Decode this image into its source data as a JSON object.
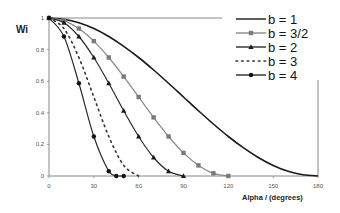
{
  "chart_data": {
    "type": "line",
    "title": "",
    "xlabel": "Alpha / (degrees)",
    "ylabel": "Wi",
    "xlim": [
      0,
      180
    ],
    "ylim": [
      0,
      1
    ],
    "x_ticks": [
      0,
      30,
      60,
      90,
      120,
      150,
      180
    ],
    "x_tick_labels": [
      "0",
      "30",
      "60",
      "90",
      "120",
      "150",
      "180"
    ],
    "y_ticks": [
      0,
      0.2,
      0.4,
      0.6,
      0.8,
      1
    ],
    "y_tick_labels": [
      "0",
      "0.2",
      "0.4",
      "0.6",
      "0.8",
      "1"
    ],
    "grid": false,
    "legend_position": "top-right",
    "series": [
      {
        "name": "b = 1",
        "style": "solid",
        "marker": "none",
        "color": "#1a1a1a",
        "width": 1.6,
        "x": [
          0,
          10,
          20,
          30,
          40,
          50,
          60,
          70,
          80,
          90,
          100,
          110,
          120,
          130,
          140,
          150,
          160,
          170,
          180
        ],
        "values": [
          1,
          0.992,
          0.97,
          0.933,
          0.883,
          0.821,
          0.75,
          0.671,
          0.587,
          0.5,
          0.413,
          0.329,
          0.25,
          0.179,
          0.117,
          0.067,
          0.03,
          0.008,
          0
        ]
      },
      {
        "name": "b = 3/2",
        "style": "solid",
        "marker": "square",
        "color": "#888888",
        "marker_color": "#7a7a7a",
        "width": 1.2,
        "x": [
          0,
          10,
          20,
          30,
          40,
          50,
          60,
          70,
          80,
          90,
          100,
          110,
          120
        ],
        "values": [
          1,
          0.983,
          0.933,
          0.854,
          0.75,
          0.629,
          0.5,
          0.371,
          0.25,
          0.146,
          0.067,
          0.017,
          0
        ]
      },
      {
        "name": "b = 2",
        "style": "solid",
        "marker": "triangle",
        "color": "#2a2a2a",
        "marker_color": "#1a1a1a",
        "width": 1.2,
        "x": [
          0,
          10,
          20,
          30,
          40,
          50,
          60,
          70,
          80,
          90
        ],
        "values": [
          1,
          0.97,
          0.883,
          0.75,
          0.587,
          0.413,
          0.25,
          0.117,
          0.03,
          0
        ]
      },
      {
        "name": "b = 3",
        "style": "dotted",
        "marker": "none",
        "color": "#333333",
        "width": 1.6,
        "x": [
          0,
          10,
          20,
          30,
          40,
          50,
          60
        ],
        "values": [
          1,
          0.933,
          0.75,
          0.5,
          0.25,
          0.067,
          0
        ]
      },
      {
        "name": "b = 4",
        "style": "solid",
        "marker": "circle",
        "color": "#2a2a2a",
        "marker_color": "#111111",
        "width": 1.2,
        "x": [
          0,
          10,
          20,
          30,
          40,
          45,
          50
        ],
        "values": [
          1,
          0.883,
          0.587,
          0.25,
          0.03,
          0,
          0
        ]
      }
    ]
  },
  "layout": {
    "plot_left": 49,
    "plot_right": 318,
    "plot_top": 18,
    "plot_bottom": 176,
    "top_border_end": 222,
    "right_border_start": 80
  }
}
